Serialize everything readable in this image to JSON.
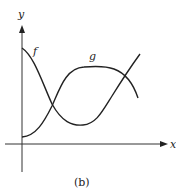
{
  "figure": {
    "caption": "(b)",
    "axes": {
      "x_label": "x",
      "y_label": "y"
    },
    "curves": [
      {
        "name": "f",
        "label": "f",
        "description": "decreasing from high y-intercept to a minimum, then increasing steeply"
      },
      {
        "name": "g",
        "label": "g",
        "description": "increasing from low y-intercept to a plateau, then decreasing"
      }
    ],
    "intersections": 2,
    "colors": {
      "ink": "#222222",
      "background": "#ffffff"
    }
  }
}
